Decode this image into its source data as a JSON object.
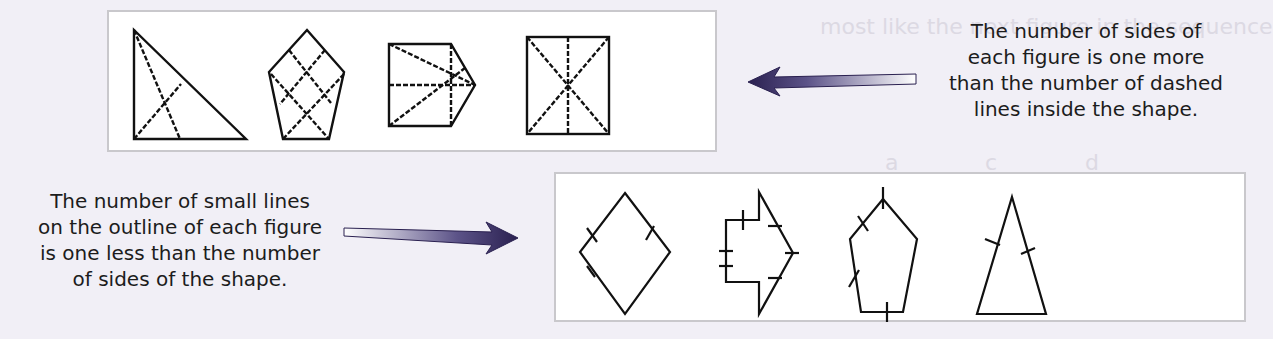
{
  "background_ghost_text": {
    "line1": "most like the next figure in the sequence",
    "line2_labels": [
      "a",
      "b",
      "c",
      "d"
    ],
    "line3": "figure in the sequence"
  },
  "top_panel": {
    "figures": [
      {
        "shape": "right-triangle",
        "sides": 3,
        "dashed_lines": 2
      },
      {
        "shape": "pentagon",
        "sides": 5,
        "dashed_lines": 4
      },
      {
        "shape": "square-with-triangle-point",
        "sides": 5,
        "dashed_lines": 4
      },
      {
        "shape": "rectangle",
        "sides": 4,
        "dashed_lines": 3
      }
    ],
    "caption_lines": [
      "The number of sides of",
      "each figure is one more",
      "than the number of dashed",
      "lines inside the shape."
    ],
    "arrow_direction": "left"
  },
  "bottom_panel": {
    "figures": [
      {
        "shape": "rhombus",
        "sides": 4,
        "tick_marks": 3
      },
      {
        "shape": "arrow-polygon",
        "sides": 8,
        "tick_marks": 7
      },
      {
        "shape": "pentagon",
        "sides": 5,
        "tick_marks": 4
      },
      {
        "shape": "isosceles-triangle",
        "sides": 3,
        "tick_marks": 2
      }
    ],
    "caption_lines": [
      "The number of small lines",
      "on the outline of each figure",
      "is one less than the number",
      "of sides of the shape."
    ],
    "arrow_direction": "right"
  },
  "colors": {
    "arrow_dark": "#2a2050",
    "arrow_light": "#ffffff",
    "panel_border": "#c9c8cc",
    "page_bg": "#f1eff6"
  }
}
